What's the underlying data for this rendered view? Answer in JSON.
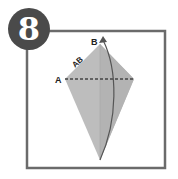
{
  "step": {
    "number": "8"
  },
  "labels": {
    "a": "A",
    "b": "B",
    "ab": "AB"
  },
  "colors": {
    "frame": "#6b6b6b",
    "badge": "#4a4a4a",
    "paper": "#bdbdbd",
    "paper_shade": "#a9a9a9",
    "fold_line": "#444444",
    "arrow": "#555555"
  }
}
